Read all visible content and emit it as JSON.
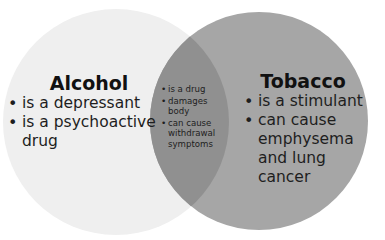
{
  "colors": {
    "background": "#ffffff",
    "left_circle": "#efefef",
    "right_circle": "#a6a6a6",
    "overlap": "#909090",
    "text": "#1e1e1e"
  },
  "left": {
    "title": "Alcohol",
    "items": [
      "is a depressant",
      "is a psychoactive drug"
    ]
  },
  "overlap": {
    "items": [
      "is a drug",
      "damages body",
      "can cause withdrawal symptoms"
    ]
  },
  "right": {
    "title": "Tobacco",
    "items": [
      "is a stimulant",
      "can cause emphysema and lung cancer"
    ]
  }
}
